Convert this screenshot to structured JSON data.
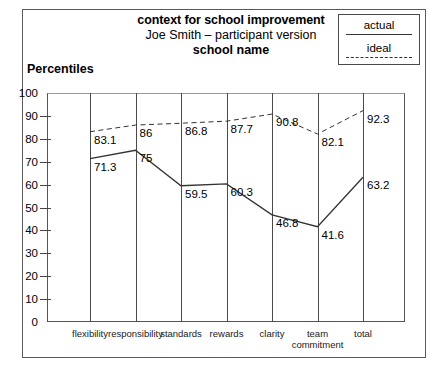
{
  "title": {
    "line1": "context for school improvement",
    "line2": "Joe Smith – participant version",
    "line3": "school name"
  },
  "legend": {
    "actual_label": "actual",
    "ideal_label": "ideal"
  },
  "axis": {
    "y_title": "Percentiles"
  },
  "chart_data": {
    "type": "line",
    "title": "context for school improvement",
    "subtitle": "Joe Smith – participant version",
    "subtitle2": "school name",
    "xlabel": "",
    "ylabel": "Percentiles",
    "ylim": [
      0,
      100
    ],
    "yticks": [
      0,
      10,
      20,
      30,
      40,
      50,
      60,
      70,
      80,
      90,
      100
    ],
    "ytick_labels": [
      "0",
      "10",
      "20",
      "30",
      "40",
      "50",
      "60",
      "70",
      "80",
      "90",
      "100"
    ],
    "grid": "vertical",
    "legend_position": "top-right",
    "categories": [
      "flexibility",
      "responsibility",
      "standards",
      "rewards",
      "clarity",
      "team\ncommitment",
      "total"
    ],
    "series": [
      {
        "name": "actual",
        "style": "solid",
        "color": "#333333",
        "values": [
          71.3,
          75,
          59.5,
          60.3,
          46.8,
          41.6,
          63.2
        ],
        "labels": [
          "71.3",
          "75",
          "59.5",
          "60.3",
          "46.8",
          "41.6",
          "63.2"
        ]
      },
      {
        "name": "ideal",
        "style": "dashed",
        "color": "#333333",
        "values": [
          83.1,
          86,
          86.8,
          87.7,
          90.8,
          82.1,
          92.3
        ],
        "labels": [
          "83.1",
          "86",
          "86.8",
          "87.7",
          "90.8",
          "82.1",
          "92.3"
        ]
      }
    ]
  },
  "colors": {
    "line": "#333333",
    "frame": "#5a5a5a",
    "grid": "#4a4a4a"
  }
}
